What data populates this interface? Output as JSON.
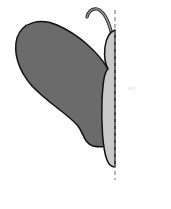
{
  "figure": {
    "title": "Half butterfly with line of symmetry",
    "elements": {
      "wing": {
        "shape": "rounded-wing",
        "fill": "#6b6b6b",
        "stroke": "#111111"
      },
      "body": {
        "shape": "elongated-oval-half",
        "fill": "#c9c9c9",
        "stroke": "#111111"
      },
      "antenna": {
        "shape": "curled-hook",
        "stroke": "#333333",
        "fill": "#9a9a9a"
      },
      "symmetry_line": {
        "style": "dashed",
        "color": "#888888",
        "x": 115
      }
    },
    "colors": {
      "background": "#ffffff",
      "wing": "#6b6b6b",
      "body": "#c9c9c9",
      "outline": "#111111",
      "dash": "#888888"
    }
  }
}
